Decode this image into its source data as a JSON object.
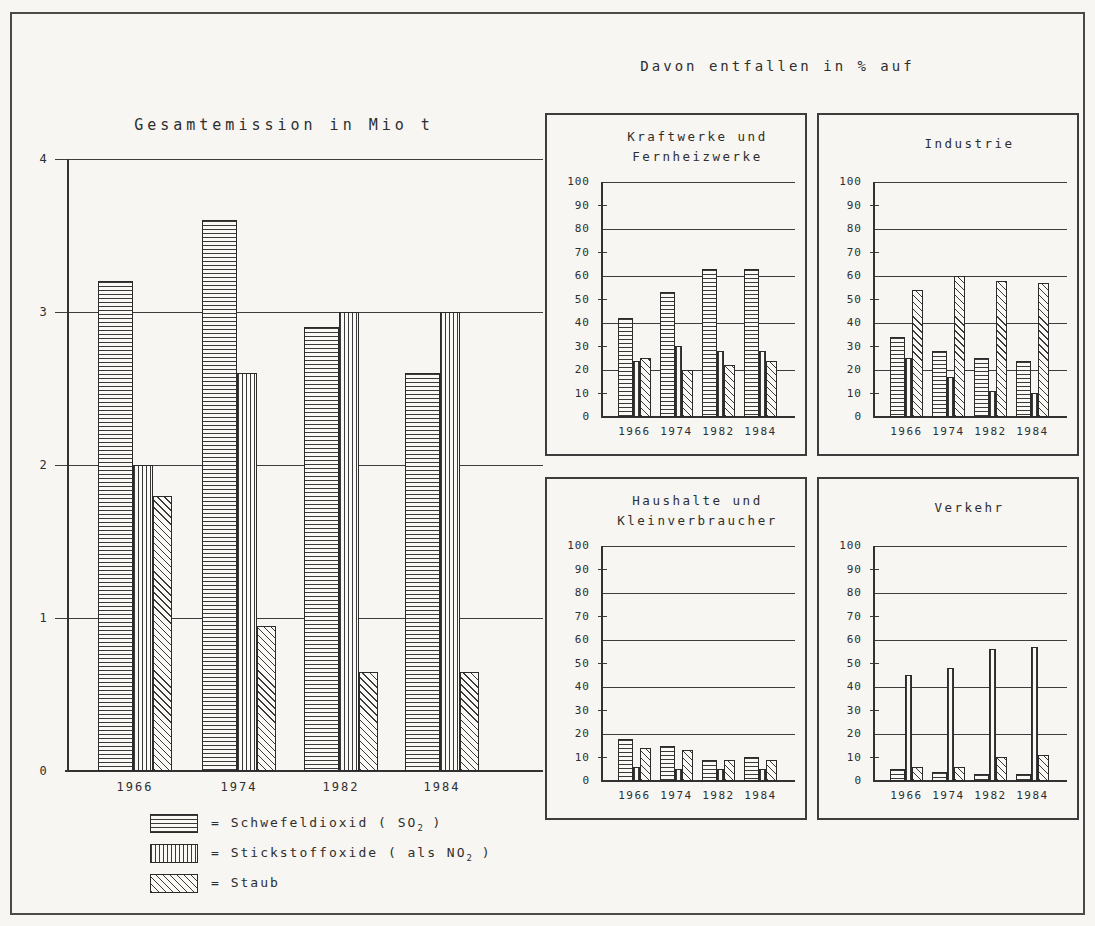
{
  "right_section": {
    "title": "Davon entfallen in % auf"
  },
  "legend": {
    "items": [
      {
        "swatch": "horizontal-lines",
        "prefix": "= Schwefeldioxid ( SO",
        "sub": "2",
        "suffix": " )"
      },
      {
        "swatch": "vertical-lines",
        "prefix": "= Stickstoffoxide ( als NO",
        "sub": "2",
        "suffix": " )"
      },
      {
        "swatch": "diagonal-lines",
        "prefix": "= Staub",
        "sub": "",
        "suffix": ""
      }
    ]
  },
  "colors": {
    "ink": "#2e2e2e",
    "background": "#f7f6f2",
    "bar_fill": "#faf9f5"
  },
  "chart_data": [
    {
      "id": "gesamtemission",
      "type": "bar",
      "title": "Gesamtemission in Mio t",
      "categories": [
        "1966",
        "1974",
        "1982",
        "1984"
      ],
      "series": [
        {
          "name": "Schwefeldioxid (SO2)",
          "pattern": "horizontal-lines",
          "values": [
            3.2,
            3.6,
            2.9,
            2.6
          ]
        },
        {
          "name": "Stickstoffoxide (als NO2)",
          "pattern": "vertical-lines",
          "values": [
            2.0,
            2.6,
            3.0,
            3.0
          ]
        },
        {
          "name": "Staub",
          "pattern": "diagonal-lines",
          "values": [
            1.8,
            0.95,
            0.65,
            0.65
          ]
        }
      ],
      "ylim": [
        0,
        4
      ],
      "ytick_label_step": 1,
      "gridline_step": 1,
      "unit": "Mio t",
      "grid": true,
      "legend_position": "below-left"
    },
    {
      "id": "kraftwerke-und-fernheizwerke",
      "type": "bar",
      "title": "Kraftwerke und Fernheizwerke",
      "title_lines": [
        "Kraftwerke und",
        "Fernheizwerke"
      ],
      "categories": [
        "1966",
        "1974",
        "1982",
        "1984"
      ],
      "series": [
        {
          "name": "Schwefeldioxid (SO2)",
          "pattern": "horizontal-lines",
          "values": [
            42,
            53,
            63,
            63
          ]
        },
        {
          "name": "Stickstoffoxide (als NO2)",
          "pattern": "vertical-lines",
          "values": [
            24,
            30,
            28,
            28
          ]
        },
        {
          "name": "Staub",
          "pattern": "diagonal-lines",
          "values": [
            25,
            20,
            22,
            24
          ]
        }
      ],
      "ylim": [
        0,
        100
      ],
      "ytick_label_step": 10,
      "gridline_step": 20,
      "unit": "%",
      "grid": true
    },
    {
      "id": "industrie",
      "type": "bar",
      "title": "Industrie",
      "title_lines": [
        "Industrie"
      ],
      "categories": [
        "1966",
        "1974",
        "1982",
        "1984"
      ],
      "series": [
        {
          "name": "Schwefeldioxid (SO2)",
          "pattern": "horizontal-lines",
          "values": [
            34,
            28,
            25,
            24
          ]
        },
        {
          "name": "Stickstoffoxide (als NO2)",
          "pattern": "vertical-lines",
          "values": [
            25,
            17,
            11,
            10
          ]
        },
        {
          "name": "Staub",
          "pattern": "diagonal-lines",
          "values": [
            54,
            60,
            58,
            57
          ]
        }
      ],
      "ylim": [
        0,
        100
      ],
      "ytick_label_step": 10,
      "gridline_step": 20,
      "unit": "%",
      "grid": true
    },
    {
      "id": "haushalte-und-kleinverbraucher",
      "type": "bar",
      "title": "Haushalte und Kleinverbraucher",
      "title_lines": [
        "Haushalte und",
        "Kleinverbraucher"
      ],
      "categories": [
        "1966",
        "1974",
        "1982",
        "1984"
      ],
      "series": [
        {
          "name": "Schwefeldioxid (SO2)",
          "pattern": "horizontal-lines",
          "values": [
            18,
            15,
            9,
            10
          ]
        },
        {
          "name": "Stickstoffoxide (als NO2)",
          "pattern": "vertical-lines",
          "values": [
            6,
            5,
            5,
            5
          ]
        },
        {
          "name": "Staub",
          "pattern": "diagonal-lines",
          "values": [
            14,
            13,
            9,
            9
          ]
        }
      ],
      "ylim": [
        0,
        100
      ],
      "ytick_label_step": 10,
      "gridline_step": 20,
      "unit": "%",
      "grid": true
    },
    {
      "id": "verkehr",
      "type": "bar",
      "title": "Verkehr",
      "title_lines": [
        "Verkehr"
      ],
      "categories": [
        "1966",
        "1974",
        "1982",
        "1984"
      ],
      "series": [
        {
          "name": "Schwefeldioxid (SO2)",
          "pattern": "horizontal-lines",
          "values": [
            5,
            4,
            3,
            3
          ]
        },
        {
          "name": "Stickstoffoxide (als NO2)",
          "pattern": "vertical-lines",
          "values": [
            45,
            48,
            56,
            57
          ]
        },
        {
          "name": "Staub",
          "pattern": "diagonal-lines",
          "values": [
            6,
            6,
            10,
            11
          ]
        }
      ],
      "ylim": [
        0,
        100
      ],
      "ytick_label_step": 10,
      "gridline_step": 20,
      "unit": "%",
      "grid": true
    }
  ]
}
